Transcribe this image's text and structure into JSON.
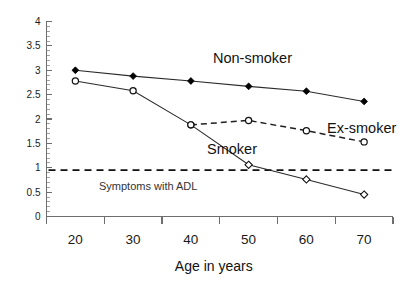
{
  "chart_data": {
    "type": "line",
    "title": "",
    "xlabel": "Age in years",
    "ylabel": "",
    "categories": [
      20,
      30,
      40,
      50,
      60,
      70
    ],
    "xtick_labels": [
      "20",
      "30",
      "40",
      "50",
      "60",
      "70"
    ],
    "ytick_labels": [
      "0",
      "0.5",
      "1",
      "1.5",
      "2",
      "2.5",
      "3",
      "3.5",
      "4"
    ],
    "ytick_values": [
      0,
      0.5,
      1,
      1.5,
      2,
      2.5,
      3,
      3.5,
      4
    ],
    "ylim": [
      0,
      4
    ],
    "y_minor_step": 0.1,
    "grid": false,
    "legend_position": "inline-annotations",
    "series": [
      {
        "name": "Non-smoker",
        "marker": "filled-diamond",
        "linestyle": "solid",
        "color": "#000000",
        "x": [
          20,
          30,
          40,
          50,
          60,
          70
        ],
        "values": [
          3.0,
          2.88,
          2.78,
          2.67,
          2.57,
          2.36
        ]
      },
      {
        "name": "Smoker",
        "marker": "open-circle-then-open-diamond",
        "linestyle": "solid",
        "color": "#2b2b2b",
        "x": [
          20,
          30,
          40,
          50,
          60,
          70
        ],
        "values": [
          2.78,
          2.58,
          1.88,
          1.06,
          0.76,
          0.45
        ]
      },
      {
        "name": "Ex-smoker",
        "marker": "open-circle",
        "linestyle": "dashed",
        "color": "#1f1f1f",
        "x": [
          40,
          50,
          60,
          70
        ],
        "values": [
          1.88,
          1.97,
          1.76,
          1.53
        ]
      }
    ],
    "reference_line": {
      "label": "Symptoms with ADL",
      "y": 0.95,
      "linestyle": "dashed",
      "color": "#111111"
    },
    "annotations": [
      {
        "text": "Non-smoker",
        "x_px": 213,
        "y_px": 63
      },
      {
        "text": "Ex-smoker",
        "x_px": 327,
        "y_px": 133
      },
      {
        "text": "Smoker",
        "x_px": 207,
        "y_px": 154
      },
      {
        "text": "Symptoms with ADL",
        "x_px": 99,
        "y_px": 190
      }
    ]
  }
}
